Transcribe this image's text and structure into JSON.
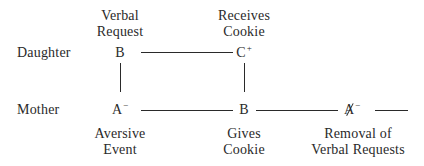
{
  "diagram": {
    "rows": {
      "daughter": "Daughter",
      "mother": "Mother"
    },
    "nodes": {
      "daughter_behavior": {
        "letter": "B",
        "superscript": "",
        "caption_line1": "Verbal",
        "caption_line2": "Request"
      },
      "daughter_consequence": {
        "letter": "C",
        "superscript": "+",
        "caption_line1": "Receives",
        "caption_line2": "Cookie"
      },
      "mother_antecedent": {
        "letter": "A",
        "superscript": "−",
        "caption_line1": "Aversive",
        "caption_line2": "Event"
      },
      "mother_behavior": {
        "letter": "B",
        "superscript": "",
        "caption_line1": "Gives",
        "caption_line2": "Cookie"
      },
      "mother_removal": {
        "letter": "A",
        "superscript": "−",
        "struck": true,
        "caption_line1": "Removal of",
        "caption_line2": "Verbal Requests"
      }
    },
    "connections": [
      {
        "from": "daughter_behavior",
        "to": "daughter_consequence",
        "orientation": "horizontal"
      },
      {
        "from": "daughter_behavior",
        "to": "mother_antecedent",
        "orientation": "vertical"
      },
      {
        "from": "daughter_consequence",
        "to": "mother_behavior",
        "orientation": "vertical"
      },
      {
        "from": "mother_antecedent",
        "to": "mother_behavior",
        "orientation": "horizontal"
      },
      {
        "from": "mother_behavior",
        "to": "mother_removal",
        "orientation": "horizontal"
      },
      {
        "from": "mother_removal",
        "to": "",
        "orientation": "horizontal-trailing"
      }
    ],
    "colors": {
      "ink": "#2a2a2a",
      "background": "#ffffff"
    }
  }
}
